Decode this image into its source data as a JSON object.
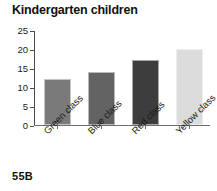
{
  "chart_data": {
    "type": "bar",
    "title": "Kindergarten children",
    "xlabel": "",
    "ylabel": "",
    "categories": [
      "Green class",
      "Blue class",
      "Red class",
      "Yellow class"
    ],
    "values": [
      12,
      14,
      17,
      20
    ],
    "colors": [
      "#7a7a7a",
      "#636363",
      "#3d3d3d",
      "#dcdcdc"
    ],
    "ylim": [
      0,
      25
    ],
    "yticks": [
      0,
      5,
      10,
      15,
      20,
      25
    ],
    "ytick_labels": [
      "0",
      "5",
      "10",
      "15",
      "20",
      "25"
    ],
    "grid": false,
    "legend": null,
    "xtick_rotation": -45
  },
  "footer": {
    "label": "55B"
  }
}
